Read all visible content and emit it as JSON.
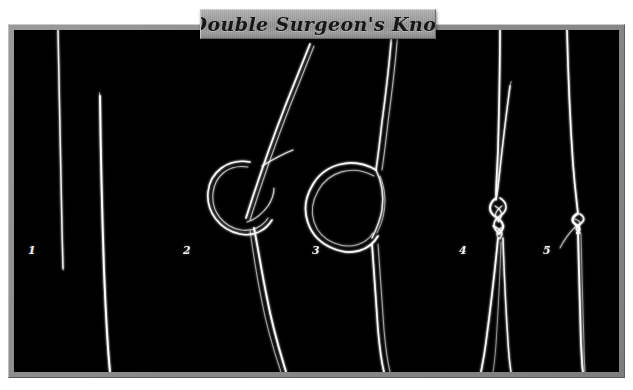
{
  "figure": {
    "title": "Double Surgeon's Knot",
    "background_color": "#ffffff",
    "panel_color": "#000000",
    "frame_color": "#8c8c8c",
    "plaque_color": "#a6a6a6",
    "line_color": "#ffffff"
  },
  "steps": [
    {
      "number": "1",
      "label_x": 28,
      "label_y": 245,
      "caption": ""
    },
    {
      "number": "2",
      "label_x": 183,
      "label_y": 245,
      "caption": ""
    },
    {
      "number": "3",
      "label_x": 312,
      "label_y": 245,
      "caption": ""
    },
    {
      "number": "4",
      "label_x": 459,
      "label_y": 245,
      "caption": ""
    },
    {
      "number": "5",
      "label_x": 543,
      "label_y": 245,
      "caption": ""
    }
  ]
}
